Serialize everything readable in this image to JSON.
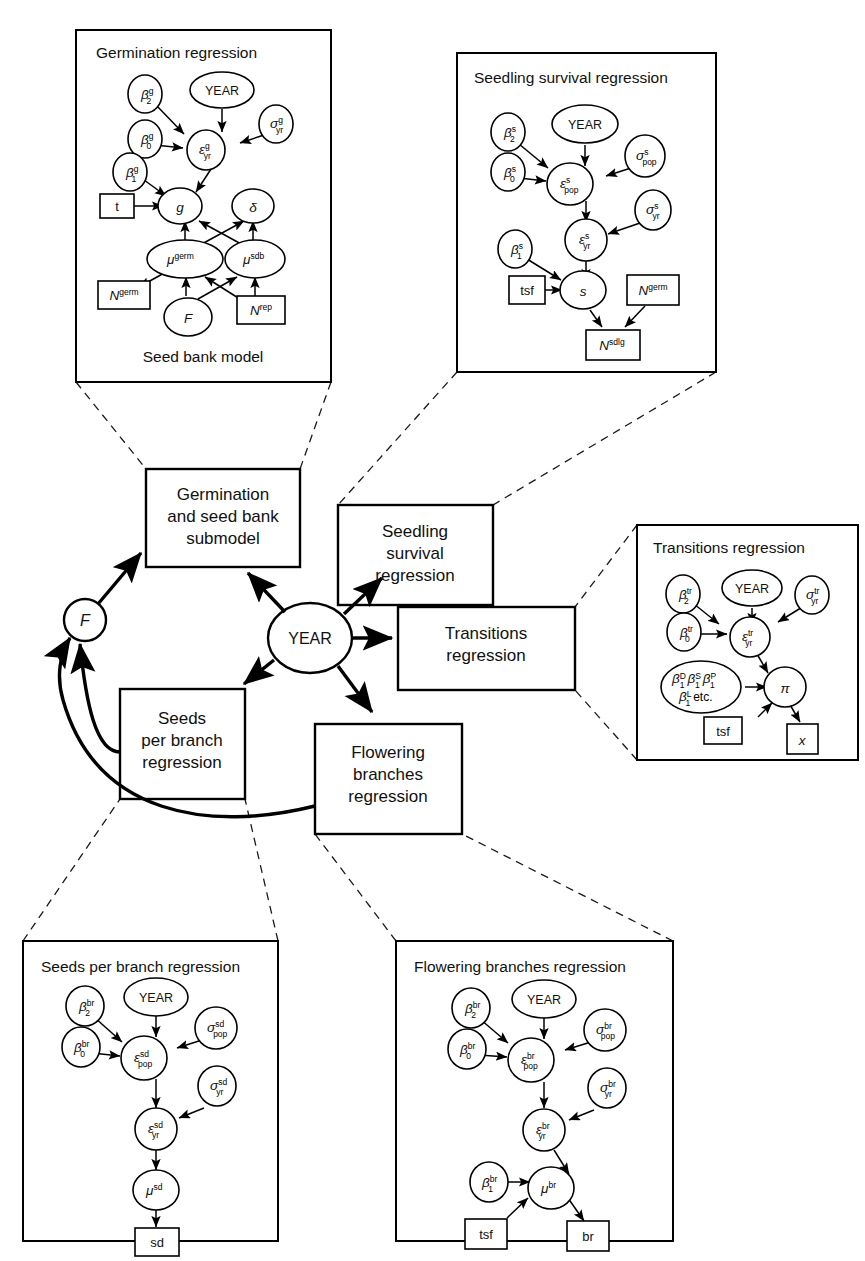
{
  "figure": {
    "type": "hierarchical-bayesian-model-diagram",
    "background": "#ffffff",
    "stroke": "#000000"
  },
  "central": {
    "year_node": "YEAR",
    "f_node": "F",
    "boxes": [
      {
        "id": "germination-submodel",
        "lines": [
          "Germination",
          "and seed bank",
          "submodel"
        ]
      },
      {
        "id": "seedling-survival",
        "lines": [
          "Seedling",
          "survival",
          "regression"
        ]
      },
      {
        "id": "transitions",
        "lines": [
          "Transitions",
          "regression"
        ]
      },
      {
        "id": "seeds-per-branch",
        "lines": [
          "Seeds",
          "per branch",
          "regression"
        ]
      },
      {
        "id": "flowering-branches",
        "lines": [
          "Flowering",
          "branches",
          "regression"
        ]
      }
    ]
  },
  "panels": {
    "germination": {
      "title": "Germination regression",
      "footer": "Seed bank model",
      "nodes": {
        "year": "YEAR",
        "beta2": {
          "base": "β",
          "sup": "g",
          "sub": "2"
        },
        "beta0": {
          "base": "β",
          "sup": "g",
          "sub": "0"
        },
        "beta1": {
          "base": "β",
          "sup": "g",
          "sub": "1"
        },
        "sigma_yr": {
          "base": "σ",
          "sup": "g",
          "sub": "yr"
        },
        "eps_yr": {
          "base": "ε",
          "sup": "g",
          "sub": "yr"
        },
        "g": "g",
        "delta": "δ",
        "mu_germ": {
          "base": "μ",
          "sup": "germ"
        },
        "mu_sdb": {
          "base": "μ",
          "sup": "sdb"
        },
        "F": "F"
      },
      "rects": {
        "tsf": "tsf",
        "N_germ": {
          "base": "N",
          "sup": "germ"
        },
        "N_rep": {
          "base": "N",
          "sup": "rep"
        }
      }
    },
    "seedling": {
      "title": "Seedling survival regression",
      "nodes": {
        "year": "YEAR",
        "beta2": {
          "base": "β",
          "sup": "s",
          "sub": "2"
        },
        "beta0": {
          "base": "β",
          "sup": "s",
          "sub": "0"
        },
        "beta1": {
          "base": "β",
          "sup": "s",
          "sub": "1"
        },
        "sigma_pop": {
          "base": "σ",
          "sup": "s",
          "sub": "pop"
        },
        "sigma_yr": {
          "base": "σ",
          "sup": "s",
          "sub": "yr"
        },
        "eps_pop": {
          "base": "ε",
          "sup": "s",
          "sub": "pop"
        },
        "eps_yr": {
          "base": "ε",
          "sup": "s",
          "sub": "yr"
        },
        "s": "s"
      },
      "rects": {
        "tsf": "tsf",
        "N_germ": {
          "base": "N",
          "sup": "germ"
        },
        "N_sdlg": {
          "base": "N",
          "sup": "sdlg"
        }
      }
    },
    "transitions": {
      "title": "Transitions regression",
      "nodes": {
        "year": "YEAR",
        "beta2": {
          "base": "β",
          "sup": "tr",
          "sub": "2"
        },
        "beta0": {
          "base": "β",
          "sup": "tr",
          "sub": "0"
        },
        "sigma_yr": {
          "base": "σ",
          "sup": "tr",
          "sub": "yr"
        },
        "eps_yr": {
          "base": "ε",
          "sup": "tr",
          "sub": "yr"
        },
        "beta_group": {
          "row1": [
            {
              "base": "β",
              "sup": "D",
              "sub": "1"
            },
            {
              "base": "β",
              "sup": "S",
              "sub": "1"
            },
            {
              "base": "β",
              "sup": "P",
              "sub": "1"
            }
          ],
          "row2": [
            {
              "base": "β",
              "sup": "L",
              "sub": "1"
            }
          ],
          "etc": "etc."
        },
        "pi": "π"
      },
      "rects": {
        "tsf": "tsf",
        "x": "x"
      }
    },
    "seeds_per_branch": {
      "title": "Seeds per branch regression",
      "nodes": {
        "year": "YEAR",
        "beta2": {
          "base": "β",
          "sup": "br",
          "sub": "2"
        },
        "beta0": {
          "base": "β",
          "sup": "br",
          "sub": "0"
        },
        "sigma_pop": {
          "base": "σ",
          "sup": "sd",
          "sub": "pop"
        },
        "sigma_yr": {
          "base": "σ",
          "sup": "sd",
          "sub": "yr"
        },
        "eps_pop": {
          "base": "ε",
          "sup": "sd",
          "sub": "pop"
        },
        "eps_yr": {
          "base": "ε",
          "sup": "sd",
          "sub": "yr"
        },
        "mu_sd": {
          "base": "μ",
          "sup": "sd"
        }
      },
      "rects": {
        "sd": "sd"
      }
    },
    "flowering_branches": {
      "title": "Flowering branches regression",
      "nodes": {
        "year": "YEAR",
        "beta2": {
          "base": "β",
          "sup": "br",
          "sub": "2"
        },
        "beta0": {
          "base": "β",
          "sup": "br",
          "sub": "0"
        },
        "beta1": {
          "base": "β",
          "sup": "br",
          "sub": "1"
        },
        "sigma_pop": {
          "base": "σ",
          "sup": "br",
          "sub": "pop"
        },
        "sigma_yr": {
          "base": "σ",
          "sup": "br",
          "sub": "yr"
        },
        "eps_pop": {
          "base": "ε",
          "sup": "br",
          "sub": "pop"
        },
        "eps_yr": {
          "base": "ε",
          "sup": "br",
          "sub": "yr"
        },
        "mu_br": {
          "base": "μ",
          "sup": "br"
        }
      },
      "rects": {
        "tsf": "tsf",
        "br": "br"
      }
    }
  }
}
